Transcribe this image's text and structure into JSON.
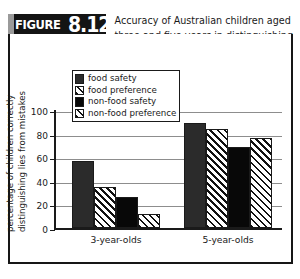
{
  "figure": {
    "label_word": "FIGURE",
    "number": "8.12",
    "title_lines": [
      "Accuracy of Australian children aged",
      "three and five years in distinguishing",
      "lies from mistakes"
    ]
  },
  "legend": {
    "entries": [
      {
        "label": "food safety",
        "pattern": "solid-dark"
      },
      {
        "label": "food preference",
        "pattern": "diagonal-hatch"
      },
      {
        "label": "non-food safety",
        "pattern": "solid-black"
      },
      {
        "label": "non-food preference",
        "pattern": "cross-hatch"
      }
    ]
  },
  "axes": {
    "y_title_line1": "percentage of children correctly",
    "y_title_line2": "distinguishing lies from mistakes",
    "y_ticks": [
      "0",
      "20",
      "40",
      "60",
      "80",
      "100"
    ]
  },
  "caption": "",
  "chart_data": {
    "type": "bar",
    "title": "Accuracy of Australian children aged three and five years in distinguishing lies from mistakes",
    "xlabel": "",
    "ylabel": "percentage of children correctly distinguishing lies from mistakes",
    "ylim": [
      0,
      100
    ],
    "yticks": [
      0,
      20,
      40,
      60,
      80,
      100
    ],
    "grid": true,
    "legend_position": "upper-left-inside",
    "categories": [
      "3-year-olds",
      "5-year-olds"
    ],
    "series": [
      {
        "name": "food safety",
        "values": [
          57,
          89
        ]
      },
      {
        "name": "food preference",
        "values": [
          35,
          84
        ]
      },
      {
        "name": "non-food safety",
        "values": [
          26,
          69
        ]
      },
      {
        "name": "non-food preference",
        "values": [
          12,
          76
        ]
      }
    ]
  }
}
